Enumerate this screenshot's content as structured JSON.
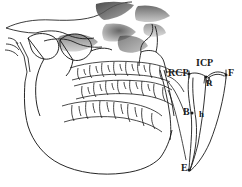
{
  "figure": {
    "background_color": "#ffffff",
    "line_color": "#1a1a1a",
    "shade_color": "#555555"
  },
  "anatomy": {
    "parts": [
      {
        "name": "cranium-outline",
        "label": "cranium"
      },
      {
        "name": "nasal-aperture",
        "label": "nasal aperture"
      },
      {
        "name": "zygomatic-arch",
        "label": "zygomatic arch"
      },
      {
        "name": "external-auditory-meatus",
        "label": "external auditory meatus"
      },
      {
        "name": "mandibular-condyle",
        "label": "mandibular condyle"
      },
      {
        "name": "coronoid-process",
        "label": "coronoid process"
      },
      {
        "name": "maxillary-teeth",
        "label": "maxillary teeth"
      },
      {
        "name": "mandibular-teeth",
        "label": "mandibular teeth"
      },
      {
        "name": "mandible-body",
        "label": "mandible"
      },
      {
        "name": "mandibular-ramus",
        "label": "ramus"
      }
    ]
  },
  "envelope": {
    "name": "posselt-envelope",
    "labels": {
      "rcp": "RCP",
      "icp": "ICP",
      "f": "F",
      "r": "R",
      "b": "B",
      "h": "h",
      "e": "E"
    },
    "points": [
      {
        "id": "RCP",
        "x": 189,
        "y": 74
      },
      {
        "id": "ICP",
        "x": 205,
        "y": 76
      },
      {
        "id": "F",
        "x": 226,
        "y": 75
      },
      {
        "id": "B",
        "x": 191,
        "y": 113
      },
      {
        "id": "E",
        "x": 189,
        "y": 170
      }
    ]
  }
}
